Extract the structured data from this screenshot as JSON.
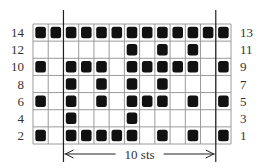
{
  "chart_data": {
    "type": "heatmap",
    "columns": 13,
    "rows": [
      {
        "left_label": "14",
        "right_label": "13",
        "filled": [
          1,
          2,
          3,
          4,
          5,
          6,
          7,
          8,
          9,
          10,
          11,
          12,
          13
        ]
      },
      {
        "left_label": "12",
        "right_label": "11",
        "filled": [
          7,
          9,
          11
        ]
      },
      {
        "left_label": "10",
        "right_label": "9",
        "filled": [
          1,
          3,
          4,
          5,
          7,
          8,
          9,
          10,
          11,
          13
        ]
      },
      {
        "left_label": "8",
        "right_label": "7",
        "filled": [
          3,
          5,
          7,
          9
        ]
      },
      {
        "left_label": "6",
        "right_label": "5",
        "filled": [
          1,
          3,
          5,
          7,
          8,
          9,
          11,
          13
        ]
      },
      {
        "left_label": "4",
        "right_label": "3",
        "filled": [
          3,
          7
        ]
      },
      {
        "left_label": "2",
        "right_label": "1",
        "filled": [
          1,
          3,
          4,
          5,
          6,
          7,
          9,
          11,
          13
        ]
      }
    ],
    "repeat": {
      "label": "10 sts",
      "start_column": 3,
      "end_column": 12
    },
    "colors": {
      "grid": "#9a9a9a",
      "filled": "#111111",
      "background": "#ffffff",
      "repeat_line": "#222222"
    }
  }
}
